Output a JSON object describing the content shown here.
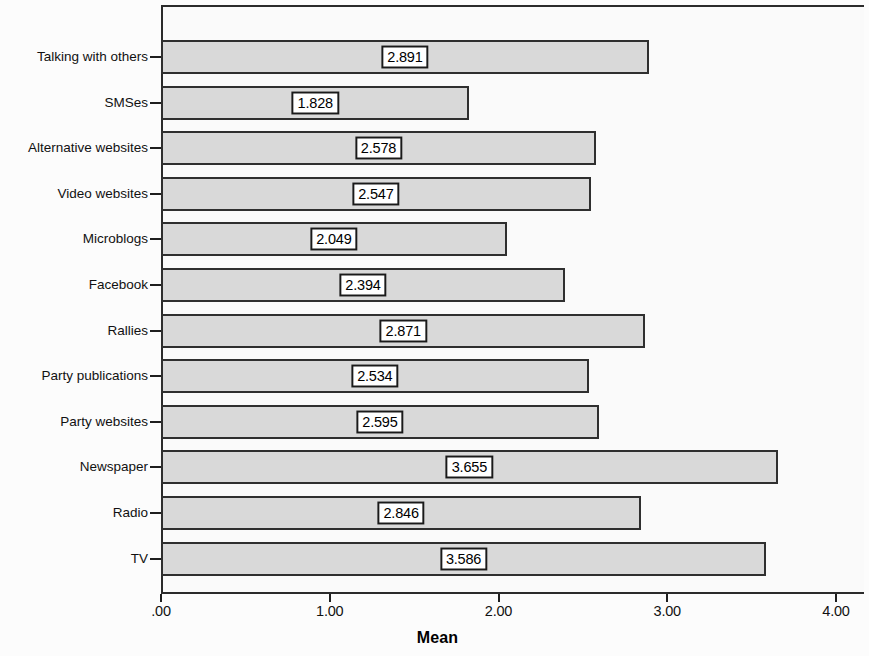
{
  "chart_data": {
    "type": "bar",
    "orientation": "horizontal",
    "title": "",
    "xlabel": "Mean",
    "ylabel": "",
    "xlim": [
      0,
      4.3
    ],
    "grid": false,
    "legend": null,
    "x_tick_labels": [
      ".00",
      "1.00",
      "2.00",
      "3.00",
      "4.00"
    ],
    "x_tick_values": [
      0,
      1,
      2,
      3,
      4
    ],
    "categories": [
      "Talking with others",
      "SMSes",
      "Alternative websites",
      "Video websites",
      "Microblogs",
      "Facebook",
      "Rallies",
      "Party publications",
      "Party websites",
      "Newspaper",
      "Radio",
      "TV"
    ],
    "values": [
      2.891,
      1.828,
      2.578,
      2.547,
      2.049,
      2.394,
      2.871,
      2.534,
      2.595,
      3.655,
      2.846,
      3.586
    ],
    "value_labels": [
      "2.891",
      "1.828",
      "2.578",
      "2.547",
      "2.049",
      "2.394",
      "2.871",
      "2.534",
      "2.595",
      "3.655",
      "2.846",
      "3.586"
    ],
    "colors": {
      "bar_fill": "#d9d9d9",
      "bar_border": "#2f2f2f",
      "axis": "#1f1f1f",
      "label_box_fill": "#ffffff",
      "label_box_border": "#1a1a1a",
      "text": "#111111",
      "plot_background": "#fafafa"
    }
  }
}
